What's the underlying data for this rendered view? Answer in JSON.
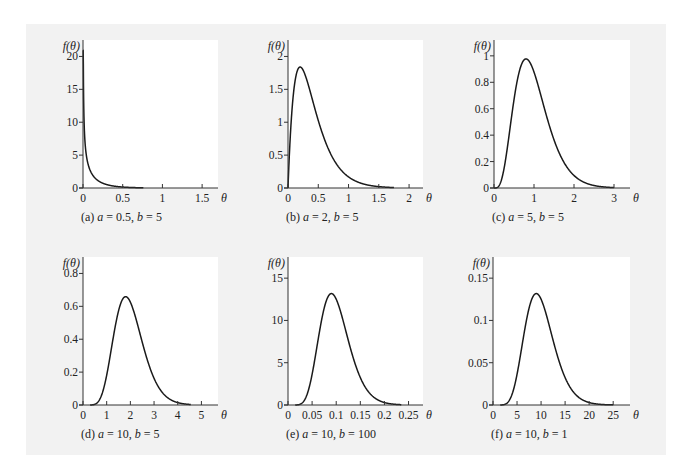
{
  "figure": {
    "background_color": "#f2f2f2",
    "plot_background_color": "#ffffff",
    "line_color": "#1a1a1a"
  },
  "chart_data": [
    {
      "type": "line",
      "id": "a",
      "caption": "(a) a = 0.5, b = 5",
      "caption_parts": {
        "prefix": "(a) ",
        "a": "0.5",
        "b": "5"
      },
      "distribution": "gamma",
      "params": {
        "a": 0.5,
        "b": 5
      },
      "xlabel": "θ",
      "ylabel": "f(θ)",
      "xlim": [
        0,
        1.7
      ],
      "ylim": [
        0,
        22.5
      ],
      "xticks": [
        0,
        0.5,
        1,
        1.5
      ],
      "xtick_labels": [
        "0",
        "0.5",
        "1",
        "1.5"
      ],
      "yticks": [
        0,
        5,
        10,
        15,
        20
      ],
      "ytick_labels": [
        "0",
        "5",
        "10",
        "15",
        "20"
      ],
      "curve_x_range": [
        0.0005,
        0.76
      ],
      "grid": false
    },
    {
      "type": "line",
      "id": "b",
      "caption": "(b) a = 2, b = 5",
      "caption_parts": {
        "prefix": "(b) ",
        "a": "2",
        "b": "5"
      },
      "distribution": "gamma",
      "params": {
        "a": 2,
        "b": 5
      },
      "xlabel": "θ",
      "ylabel": "f(θ)",
      "xlim": [
        0,
        2.23
      ],
      "ylim": [
        0,
        2.25
      ],
      "xticks": [
        0,
        0.5,
        1,
        1.5,
        2
      ],
      "xtick_labels": [
        "0",
        "0.5",
        "1",
        "1.5",
        "2"
      ],
      "yticks": [
        0,
        0.5,
        1,
        1.5,
        2
      ],
      "ytick_labels": [
        "0",
        "0.5",
        "1",
        "1.5",
        "2"
      ],
      "curve_x_range": [
        0,
        1.75
      ],
      "peak": {
        "x": 0.2,
        "y": 1.84
      },
      "grid": false
    },
    {
      "type": "line",
      "id": "c",
      "caption": "(c) a = 5, b = 5",
      "caption_parts": {
        "prefix": "(c) ",
        "a": "5",
        "b": "5"
      },
      "distribution": "gamma",
      "params": {
        "a": 5,
        "b": 5
      },
      "xlabel": "θ",
      "ylabel": "f(θ)",
      "xlim": [
        0,
        3.4
      ],
      "ylim": [
        0,
        1.12
      ],
      "xticks": [
        0,
        1,
        2,
        3
      ],
      "xtick_labels": [
        "0",
        "1",
        "2",
        "3"
      ],
      "yticks": [
        0,
        0.2,
        0.4,
        0.6,
        0.8,
        1
      ],
      "ytick_labels": [
        "0",
        "0.2",
        "0.4",
        "0.6",
        "0.8",
        "1"
      ],
      "curve_x_range": [
        0,
        3.0
      ],
      "peak": {
        "x": 0.8,
        "y": 0.98
      },
      "grid": false
    },
    {
      "type": "line",
      "id": "d",
      "caption": "(d) a = 10, b = 5",
      "caption_parts": {
        "prefix": "(d) ",
        "a": "10",
        "b": "5"
      },
      "distribution": "gamma",
      "params": {
        "a": 10,
        "b": 5
      },
      "xlabel": "θ",
      "ylabel": "f(θ)",
      "xlim": [
        0,
        5.7
      ],
      "ylim": [
        0,
        0.9
      ],
      "xticks": [
        0,
        1,
        2,
        3,
        4,
        5
      ],
      "xtick_labels": [
        "0",
        "1",
        "2",
        "3",
        "4",
        "5"
      ],
      "yticks": [
        0,
        0.2,
        0.4,
        0.6,
        0.8
      ],
      "ytick_labels": [
        "0",
        "0.2",
        "0.4",
        "0.6",
        "0.8"
      ],
      "curve_x_range": [
        0.3,
        4.55
      ],
      "peak": {
        "x": 1.8,
        "y": 0.65
      },
      "grid": false
    },
    {
      "type": "line",
      "id": "e",
      "caption": "(e) a = 10, b = 100",
      "caption_parts": {
        "prefix": "(e) ",
        "a": "10",
        "b": "100"
      },
      "distribution": "gamma",
      "params": {
        "a": 10,
        "b": 100
      },
      "xlabel": "θ",
      "ylabel": "f(θ)",
      "xlim": [
        0,
        0.28
      ],
      "ylim": [
        0,
        17.5
      ],
      "xticks": [
        0,
        0.05,
        0.1,
        0.15,
        0.2,
        0.25
      ],
      "xtick_labels": [
        "0",
        "0.05",
        "0.1",
        "0.15",
        "0.2",
        "0.25"
      ],
      "yticks": [
        0,
        5,
        10,
        15
      ],
      "ytick_labels": [
        "0",
        "5",
        "10",
        "15"
      ],
      "curve_x_range": [
        0.015,
        0.235
      ],
      "peak": {
        "x": 0.09,
        "y": 13.2
      },
      "grid": false
    },
    {
      "type": "line",
      "id": "f",
      "caption": "(f) a = 10, b = 1",
      "caption_parts": {
        "prefix": "(f) ",
        "a": "10",
        "b": "1"
      },
      "distribution": "gamma",
      "params": {
        "a": 10,
        "b": 1
      },
      "xlabel": "θ",
      "ylabel": "f(θ)",
      "xlim": [
        0,
        28.5
      ],
      "ylim": [
        0,
        0.175
      ],
      "xticks": [
        0,
        5,
        10,
        15,
        20,
        25
      ],
      "xtick_labels": [
        "0",
        "5",
        "10",
        "15",
        "20",
        "25"
      ],
      "yticks": [
        0,
        0.05,
        0.1,
        0.15
      ],
      "ytick_labels": [
        "0",
        "0.05",
        "0.1",
        "0.15"
      ],
      "curve_x_range": [
        1.5,
        25
      ],
      "peak": {
        "x": 9,
        "y": 0.13
      },
      "grid": false
    }
  ]
}
